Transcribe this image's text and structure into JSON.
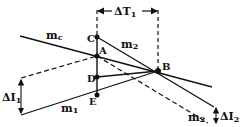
{
  "colors": {
    "ink": "#111111",
    "background": "#ffffff"
  },
  "points": {
    "C": {
      "label": "C",
      "x": 97,
      "y": 37
    },
    "A": {
      "label": "A",
      "x": 97,
      "y": 56
    },
    "D": {
      "label": "D",
      "x": 97,
      "y": 77
    },
    "E": {
      "label": "E",
      "x": 97,
      "y": 95
    },
    "B": {
      "label": "B",
      "x": 158,
      "y": 71
    }
  },
  "lines": {
    "mc": {
      "label": "m",
      "sub": "c"
    },
    "m2": {
      "label": "m",
      "sub": "2"
    },
    "m2_dashed": {
      "label": "m",
      "sub": "2"
    },
    "m1": {
      "label": "m",
      "sub": "1"
    }
  },
  "dimensions": {
    "delta_t1": {
      "symbol": "ΔT",
      "sub": "1"
    },
    "delta_i1": {
      "symbol": "ΔI",
      "sub": "1"
    },
    "delta_i2": {
      "symbol": "ΔI",
      "sub": "2"
    }
  }
}
